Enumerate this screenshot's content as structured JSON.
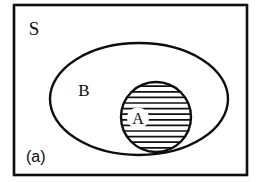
{
  "figure": {
    "caption": "(a)",
    "universal_set_label": "S",
    "outer_set_label": "B",
    "inner_set_label": "A",
    "colors": {
      "background": "#ffffff",
      "stroke": "#0d0d0d",
      "hatch": "#111111"
    }
  },
  "chart_data": {
    "type": "diagram",
    "title": "(a)",
    "shapes": [
      {
        "name": "universal-set-rectangle",
        "label": "S",
        "kind": "rect",
        "x": 14,
        "y": 5,
        "width": 233,
        "height": 170,
        "fill": "none",
        "stroke_width": 2.6
      },
      {
        "name": "set-b-ellipse",
        "label": "B",
        "kind": "ellipse",
        "cx": 139,
        "cy": 99,
        "rx": 89,
        "ry": 56,
        "fill": "none",
        "stroke_width": 2.4
      },
      {
        "name": "set-a-circle",
        "label": "A",
        "kind": "circle",
        "cx": 156,
        "cy": 117,
        "r": 35,
        "fill": "horizontal-hatch",
        "stroke_width": 2.4,
        "hatch_lines": 12,
        "hatch_spacing": 5.6
      }
    ],
    "labels": [
      {
        "name": "label-s",
        "text": "S",
        "x": 34,
        "y": 35,
        "font_size": 19,
        "style": "serif"
      },
      {
        "name": "label-b",
        "text": "B",
        "x": 84,
        "y": 96,
        "font_size": 17,
        "style": "serif"
      },
      {
        "name": "label-a",
        "text": "A",
        "x": 138,
        "y": 124,
        "font_size": 16,
        "style": "serif"
      },
      {
        "name": "label-caption",
        "text": "(a)",
        "x": 26,
        "y": 162,
        "font_size": 16,
        "style": "sans"
      }
    ],
    "relationship": "A ⊂ B ⊂ S"
  }
}
